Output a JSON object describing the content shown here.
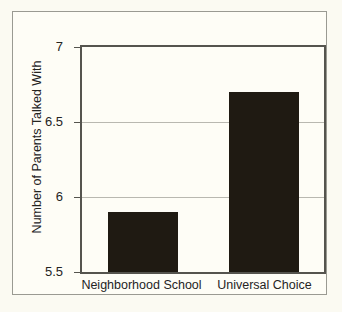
{
  "chart_data": {
    "type": "bar",
    "title": "",
    "xlabel": "",
    "ylabel": "Number of Parents Talked With",
    "categories": [
      "Neighborhood School",
      "Universal Choice"
    ],
    "values": [
      5.9,
      6.7
    ],
    "series": [
      {
        "name": "Number of Parents Talked With",
        "values": [
          5.9,
          6.7
        ]
      }
    ],
    "ylim": [
      5.5,
      7
    ],
    "yticks": [
      5.5,
      6,
      6.5,
      7
    ],
    "ytick_labels": [
      "5.5",
      "6",
      "6.5",
      "7"
    ],
    "xlim_categories": 2,
    "grid": "horizontal",
    "legend": "none",
    "bar_color": "#1f1a12",
    "background_color": "#fefdf6",
    "gridline_color": "#b9b8b0",
    "axis_color": "#55544e"
  }
}
